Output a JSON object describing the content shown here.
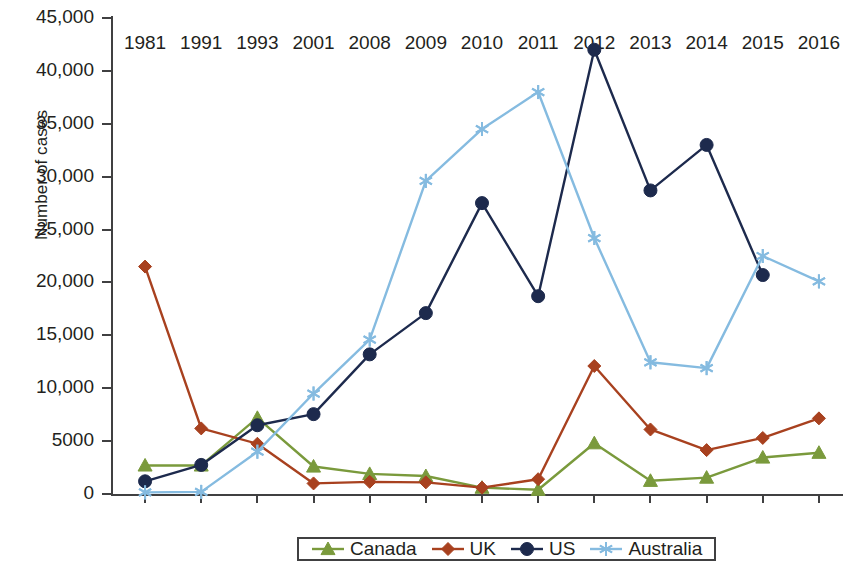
{
  "chart_data": {
    "type": "line",
    "title": "",
    "xlabel": "",
    "ylabel": "Number of cases",
    "categories": [
      "1981",
      "1991",
      "1993",
      "2001",
      "2008",
      "2009",
      "2010",
      "2011",
      "2012",
      "2013",
      "2014",
      "2015",
      "2016"
    ],
    "ylim": [
      0,
      45000
    ],
    "yticks": [
      0,
      5000,
      10000,
      15000,
      20000,
      25000,
      30000,
      35000,
      40000,
      45000
    ],
    "ytick_labels": [
      "0",
      "5000",
      "10,000",
      "15,000",
      "20,000",
      "25,000",
      "30,000",
      "35,000",
      "40,000",
      "45,000"
    ],
    "grid": false,
    "legend_position": "bottom",
    "series": [
      {
        "name": "Canada",
        "color": "#7a9a3c",
        "marker": "triangle",
        "values": [
          2700,
          2700,
          7200,
          2600,
          1900,
          1700,
          600,
          400,
          4800,
          1250,
          1550,
          3450,
          3900
        ]
      },
      {
        "name": "UK",
        "color": "#a8411f",
        "marker": "diamond",
        "values": [
          21500,
          6200,
          4750,
          1000,
          1150,
          1100,
          600,
          1400,
          12100,
          6100,
          4150,
          5300,
          7150
        ]
      },
      {
        "name": "US",
        "color": "#1d2a4d",
        "marker": "circle",
        "values": [
          1200,
          2750,
          6500,
          7550,
          13200,
          17100,
          27500,
          18700,
          42000,
          28700,
          33000,
          20700,
          null
        ]
      },
      {
        "name": "Australia",
        "color": "#85bbe0",
        "marker": "asterisk",
        "values": [
          150,
          200,
          4000,
          9500,
          14600,
          29600,
          34500,
          38000,
          24200,
          12450,
          11900,
          22500,
          20100
        ]
      }
    ]
  }
}
